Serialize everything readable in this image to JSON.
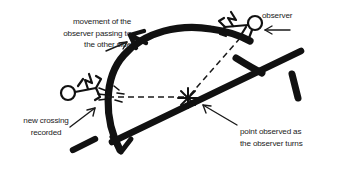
{
  "figure": {
    "ink_color": "#111111",
    "text_color": "#1b1b1b",
    "background": "#ffffff"
  },
  "labels": {
    "movement": "movement of the\nobserver passing to\nthe other side",
    "observer": "observer",
    "new_crossing": "new crossing\nrecorded",
    "point_observed": "point observed as\nthe observer turns"
  },
  "icons": {
    "stick_figure_left": "stick-figure-icon",
    "stick_figure_right": "stick-figure-icon",
    "star_marker": "star-burst-icon",
    "arrow_movement": "arrow-icon",
    "arrow_observer": "arrow-icon",
    "arrow_new_crossing": "arrow-icon",
    "arrow_point_observed": "arrow-icon",
    "arc_arrow_top": "arrowhead-icon",
    "arc_arrow_bottom": "arrowhead-icon"
  }
}
